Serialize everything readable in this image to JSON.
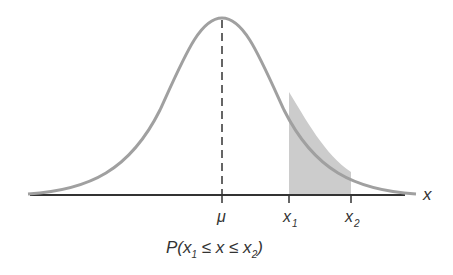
{
  "diagram": {
    "type": "normal-distribution-probability",
    "axis_label": "x",
    "ticks": [
      {
        "label": "μ",
        "sub": ""
      },
      {
        "label": "x",
        "sub": "1"
      },
      {
        "label": "x",
        "sub": "2"
      }
    ],
    "caption": {
      "prefix": "P(x",
      "sub1": "1",
      "middle": " ≤ x ≤ x",
      "sub2": "2",
      "suffix": ")"
    },
    "colors": {
      "curve": "#a0a0a0",
      "shade": "#cccccc",
      "axis": "#333333",
      "mean_line": "#333333"
    }
  }
}
